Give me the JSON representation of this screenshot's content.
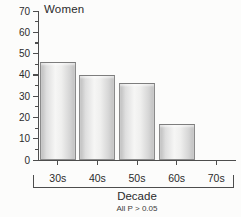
{
  "chart_data": {
    "type": "bar",
    "title": "Women",
    "categories": [
      "30s",
      "40s",
      "50s",
      "60s",
      "70s"
    ],
    "values": [
      46,
      40,
      36,
      17,
      0
    ],
    "xlabel": "Decade",
    "ylabel": "",
    "ylim": [
      0,
      70
    ],
    "yticks": [
      0,
      10,
      20,
      30,
      40,
      50,
      60,
      70
    ],
    "minor_tick_step": 5,
    "annotation": "All P > 0.05",
    "grid": false,
    "legend": null,
    "bar_color_light": "#f6f6f5",
    "bar_color_dark": "#bdbdbd",
    "bar_border_color": "#8a8a8a",
    "axis_color": "#4d4d4d",
    "text_color": "#2b2b2b"
  }
}
